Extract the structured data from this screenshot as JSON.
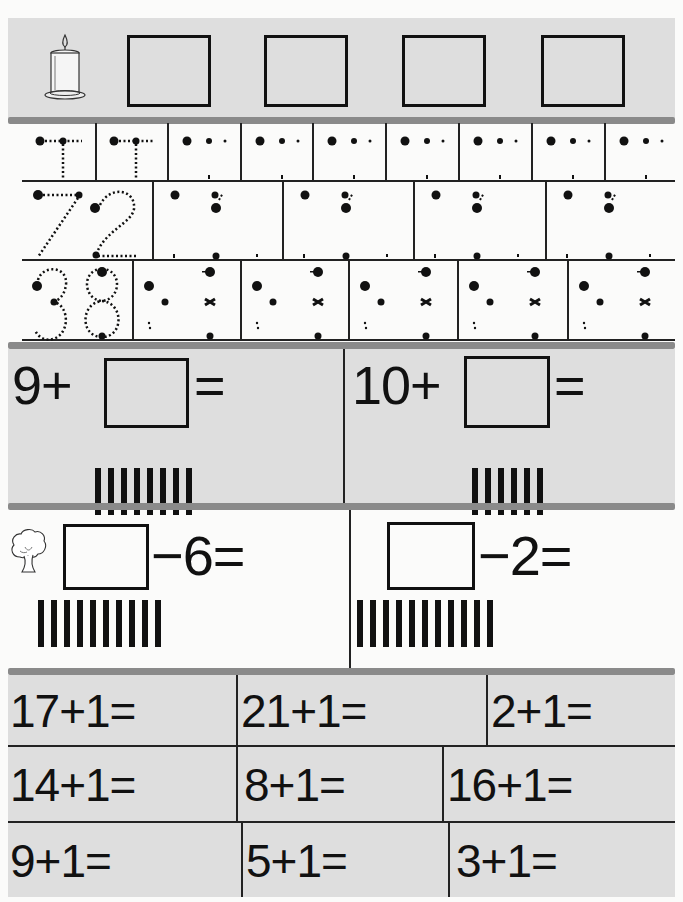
{
  "worksheet": {
    "title_row": {
      "icon": "candle-icon",
      "answer_boxes": 4
    },
    "tracing": {
      "rows": [
        {
          "label": "T",
          "guided_cells": 2,
          "dot_cells": 7
        },
        {
          "label": "72",
          "guided_cells": 1,
          "dot_cells": 4
        },
        {
          "label": "38",
          "guided_cells": 1,
          "dot_cells": 5
        }
      ]
    },
    "addition_boxes": [
      {
        "left": "9+",
        "right": "=",
        "tally_count": 8
      },
      {
        "left": "10+",
        "right": "=",
        "tally_count": 6
      }
    ],
    "subtraction_boxes": {
      "icon": "tree-icon",
      "items": [
        {
          "right": "−6=",
          "tally_count": 10
        },
        {
          "right": "−2=",
          "tally_count": 11
        }
      ]
    },
    "plus_one": {
      "rows": [
        [
          "17+1=",
          "21+1=",
          "2+1="
        ],
        [
          "14+1=",
          "8+1=",
          "16+1="
        ],
        [
          "9+1=",
          "5+1=",
          "3+1="
        ]
      ]
    }
  },
  "colors": {
    "panel_gray": "#dedede",
    "divider_gray": "#8a8a8a",
    "ink": "#111111"
  }
}
